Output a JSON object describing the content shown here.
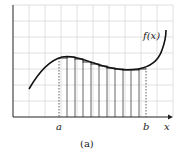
{
  "figure": {
    "caption": "(a)",
    "function_label": "f(x)",
    "x_axis_label": "x",
    "a_label": "a",
    "b_label": "b"
  },
  "diagram": {
    "type": "riemann_sum",
    "grid": {
      "x0": 13,
      "y0": 5,
      "x1": 173,
      "y1": 117,
      "step": 16
    },
    "a_x": 59,
    "b_x": 146,
    "strip_lines_x": [
      59,
      67,
      75,
      83,
      91,
      99,
      107,
      115,
      123,
      131,
      139,
      146
    ],
    "colors": {
      "grid": "#d8d8d8",
      "curve": "#111111",
      "axis": "#222222",
      "strips": "#555555"
    }
  }
}
